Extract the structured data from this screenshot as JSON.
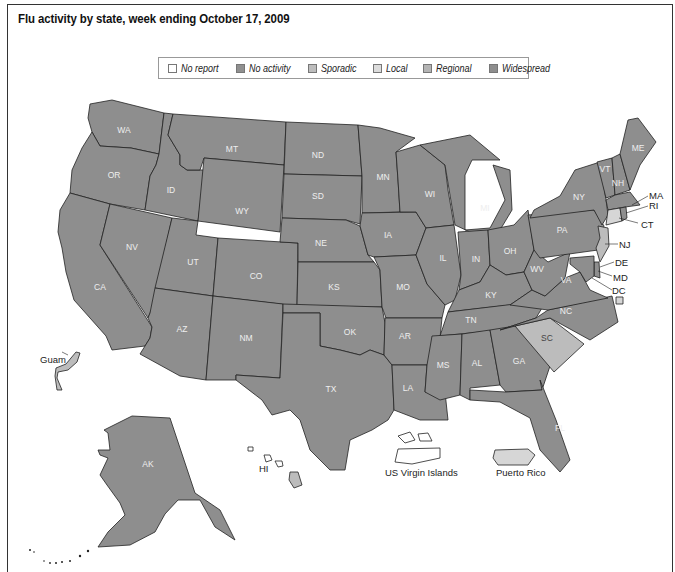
{
  "title": "Flu activity by state, week ending October 17, 2009",
  "legend": {
    "items": [
      {
        "label": "No report",
        "color": "#ffffff"
      },
      {
        "label": "No activity",
        "color": "#8e8e8e"
      },
      {
        "label": "Sporadic",
        "color": "#bdbdbd"
      },
      {
        "label": "Local",
        "color": "#d9d9d9"
      },
      {
        "label": "Regional",
        "color": "#b4b4b4"
      },
      {
        "label": "Widespread",
        "color": "#8e8e8e"
      }
    ]
  },
  "colors": {
    "widespread": "#8e8e8e",
    "regional": "#bcbcbc",
    "local": "#d6d6d6",
    "border": "#222222"
  },
  "states": {
    "WA": "WA",
    "OR": "OR",
    "CA": "CA",
    "ID": "ID",
    "NV": "NV",
    "MT": "MT",
    "WY": "WY",
    "UT": "UT",
    "AZ": "AZ",
    "CO": "CO",
    "NM": "NM",
    "ND": "ND",
    "SD": "SD",
    "NE": "NE",
    "KS": "KS",
    "OK": "OK",
    "TX": "TX",
    "MN": "MN",
    "IA": "IA",
    "MO": "MO",
    "AR": "AR",
    "LA": "LA",
    "WI": "WI",
    "IL": "IL",
    "MI": "MI",
    "IN": "IN",
    "OH": "OH",
    "KY": "KY",
    "TN": "TN",
    "MS": "MS",
    "AL": "AL",
    "GA": "GA",
    "FL": "FL",
    "SC": "SC",
    "NC": "NC",
    "VA": "VA",
    "WV": "WV",
    "PA": "PA",
    "NY": "NY",
    "VT": "VT",
    "NH": "NH",
    "ME": "ME",
    "MA": "MA",
    "RI": "RI",
    "CT": "CT",
    "NJ": "NJ",
    "DE": "DE",
    "MD": "MD",
    "DC": "DC",
    "AK": "AK",
    "HI": "HI"
  },
  "territories": {
    "guam": "Guam",
    "usvi": "US Virgin Islands",
    "pr": "Puerto Rico"
  }
}
